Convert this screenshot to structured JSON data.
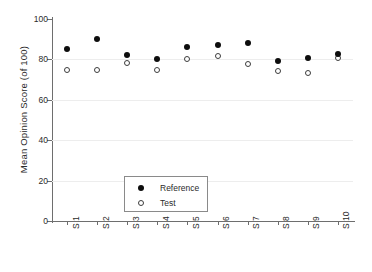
{
  "chart_data": {
    "type": "scatter",
    "title": "",
    "xlabel": "",
    "ylabel": "Mean Opinion Score (of 100)",
    "categories": [
      "S 1",
      "S 2",
      "S 3",
      "S 4",
      "S 5",
      "S 6",
      "S 7",
      "S 8",
      "S 9",
      "S 10"
    ],
    "series": [
      {
        "name": "Reference",
        "marker": "filled-circle",
        "color": "#0d0d0d",
        "values": [
          85,
          90,
          82,
          80,
          86,
          87,
          88,
          79,
          80.5,
          82.5
        ]
      },
      {
        "name": "Test",
        "marker": "open-circle",
        "color": "#ffffff",
        "values": [
          75,
          75,
          78,
          75,
          80,
          81.5,
          77.5,
          74.5,
          73.5,
          80.5
        ]
      }
    ],
    "ylim": [
      0,
      100
    ],
    "yticks": [
      0,
      20,
      40,
      60,
      80,
      100
    ],
    "ytick_labels": [
      "0",
      "20",
      "40",
      "60",
      "80",
      "100"
    ],
    "grid": true,
    "grid_axis": "y",
    "legend_position": "lower-left",
    "legend_entries": [
      "Reference",
      "Test"
    ]
  },
  "axis": {
    "y_title": "Mean Opinion Score (of 100)"
  },
  "legend": {
    "reference_label": "Reference",
    "test_label": "Test"
  }
}
